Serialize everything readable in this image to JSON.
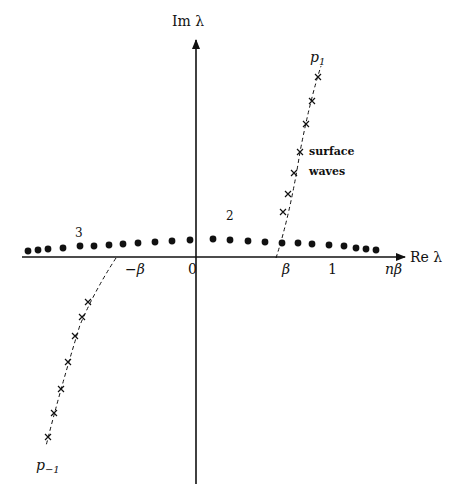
{
  "diagram": {
    "axes": {
      "x_label": "Re λ",
      "y_label": "Im λ",
      "ticks": [
        {
          "label": "−β",
          "x": 125
        },
        {
          "label": "0",
          "x": 188
        },
        {
          "label": "β",
          "x": 282
        },
        {
          "label": "1",
          "x": 328
        },
        {
          "label": "nβ",
          "x": 385
        }
      ]
    },
    "region_labels": [
      {
        "label": "2",
        "x": 226,
        "y": 220
      },
      {
        "label": "3",
        "x": 75,
        "y": 237
      }
    ],
    "branch_labels": {
      "upper": "p",
      "upper_sub": "1",
      "lower": "p",
      "lower_sub": "−1"
    },
    "annotation": {
      "line1": "surface",
      "line2": "waves"
    },
    "dots_left": [
      [
        28,
        251
      ],
      [
        38,
        250
      ],
      [
        48,
        249
      ],
      [
        63,
        248
      ],
      [
        80,
        246
      ],
      [
        94,
        246
      ],
      [
        109,
        245
      ],
      [
        123,
        244
      ],
      [
        138,
        243
      ],
      [
        155,
        242
      ],
      [
        172,
        241
      ],
      [
        190,
        240
      ]
    ],
    "dots_right": [
      [
        213,
        239
      ],
      [
        230,
        240
      ],
      [
        248,
        241
      ],
      [
        265,
        242
      ],
      [
        282,
        243
      ],
      [
        298,
        243
      ],
      [
        312,
        244
      ],
      [
        329,
        245
      ],
      [
        344,
        246
      ],
      [
        356,
        248
      ],
      [
        366,
        249
      ],
      [
        376,
        250
      ]
    ],
    "crosses_upper": [
      [
        318,
        77
      ],
      [
        312,
        101
      ],
      [
        306,
        124
      ],
      [
        300,
        152
      ],
      [
        294,
        173
      ],
      [
        288,
        194
      ],
      [
        283,
        212
      ]
    ],
    "crosses_lower": [
      [
        88,
        302
      ],
      [
        82,
        317
      ],
      [
        75,
        336
      ],
      [
        68,
        362
      ],
      [
        61,
        389
      ],
      [
        54,
        413
      ],
      [
        48,
        437
      ]
    ]
  }
}
